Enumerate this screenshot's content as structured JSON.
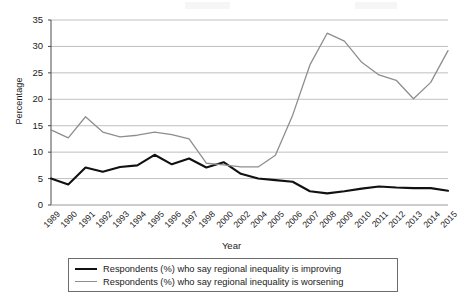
{
  "chart_data": {
    "type": "line",
    "title": "",
    "xlabel": "Year",
    "ylabel": "Percentage",
    "ylim": [
      0,
      35
    ],
    "ytick_step": 5,
    "yticks": [
      0,
      5,
      10,
      15,
      20,
      25,
      30,
      35
    ],
    "grid": "horizontal",
    "legend_position": "bottom",
    "categories": [
      "1989",
      "1990",
      "1991",
      "1992",
      "1993",
      "1994",
      "1995",
      "1996",
      "1997",
      "1998",
      "2000",
      "2002",
      "2004",
      "2005",
      "2006",
      "2007",
      "2008",
      "2009",
      "2010",
      "2011",
      "2012",
      "2013",
      "2014",
      "2015"
    ],
    "series": [
      {
        "name": "Respondents (%) who say regional inequality is improving",
        "color": "#111111",
        "values": [
          5.0,
          3.9,
          7.1,
          6.3,
          7.2,
          7.5,
          9.5,
          7.7,
          8.8,
          7.1,
          8.1,
          5.9,
          5.0,
          4.7,
          4.4,
          2.6,
          2.2,
          2.6,
          3.1,
          3.5,
          3.3,
          3.2,
          3.2,
          2.7
        ]
      },
      {
        "name": "Respondents (%) who say regional inequality is worsening",
        "color": "#8e8e8e",
        "values": [
          14.2,
          12.7,
          16.7,
          13.8,
          12.9,
          13.2,
          13.8,
          13.3,
          12.5,
          7.9,
          7.6,
          7.2,
          7.2,
          9.4,
          17.0,
          26.5,
          32.5,
          31.0,
          27.0,
          24.6,
          23.6,
          20.1,
          23.2,
          29.2
        ]
      }
    ]
  },
  "axis": {
    "y_title": "Percentage",
    "x_title": "Year"
  },
  "legend": {
    "items": [
      {
        "label": "Respondents (%) who say regional inequality is improving"
      },
      {
        "label": "Respondents (%) who say regional inequality is worsening"
      }
    ]
  }
}
